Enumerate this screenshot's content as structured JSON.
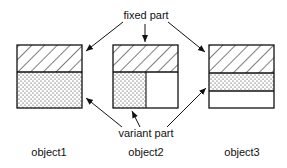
{
  "diagram": {
    "labels": {
      "fixed": "fixed part",
      "variant": "variant part"
    },
    "objects": [
      {
        "name": "object1",
        "layout": "fixed-top, variant-bottom-full"
      },
      {
        "name": "object2",
        "layout": "fixed-top, variant-bottom-left-half, empty-bottom-right"
      },
      {
        "name": "object3",
        "layout": "fixed-top, variant-middle-strip, empty-bottom"
      }
    ],
    "colors": {
      "stroke": "#111111",
      "background": "#ffffff"
    }
  }
}
